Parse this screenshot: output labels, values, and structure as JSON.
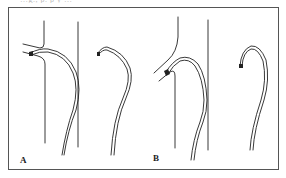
{
  "figure": {
    "top_text_clipped": "…g., p. p y …",
    "panels": [
      {
        "label": "A",
        "description": "Catheter engaging branch vessel from straight parent vessel; catheter shape shown outside vessel at right"
      },
      {
        "label": "B",
        "description": "Catheter with angled tip engaging branch vessel; catheter shape shown outside vessel at right"
      }
    ],
    "colors": {
      "line": "#222222",
      "frame": "#555555",
      "background": "#ffffff"
    }
  }
}
